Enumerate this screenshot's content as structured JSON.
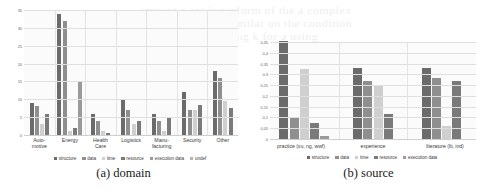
{
  "figure": {
    "bleed_lines": [
      "amount a set is perform of the a complex",
      "because a source similar on the condition",
      "these are using k for a using"
    ]
  },
  "panels": [
    {
      "id": "a",
      "caption": "(a) domain",
      "legend": [
        "structure",
        "data",
        "time",
        "resource",
        "execution data",
        "undef"
      ],
      "colors": [
        "#6b6b6b",
        "#8f8f8f",
        "#cfcfcf",
        "#7a7a7a",
        "#9a9a9a",
        "#b5b5b5"
      ],
      "chart_data": {
        "type": "bar",
        "title": "(a) domain",
        "xlabel": "",
        "ylabel": "",
        "ylim": [
          0,
          35
        ],
        "yticks": [
          0,
          5,
          10,
          15,
          20,
          25,
          30,
          35
        ],
        "ytick_labels": [
          "0",
          "5",
          "10",
          "15",
          "20",
          "25",
          "30",
          "35"
        ],
        "grid": true,
        "legend_position": "bottom",
        "categories": [
          "Auto-\nmotive",
          "Energy",
          "Health\nCare",
          "Logistics",
          "Manu-\nfacturing",
          "Security",
          "Other"
        ],
        "series": [
          {
            "name": "structure",
            "values": [
              9,
              34,
              6,
              10,
              6,
              12,
              18
            ]
          },
          {
            "name": "data",
            "values": [
              8,
              32,
              4,
              7,
              4,
              7,
              16
            ]
          },
          {
            "name": "time",
            "values": [
              3,
              1,
              1,
              3,
              1,
              7,
              9.5
            ]
          },
          {
            "name": "resource",
            "values": [
              6,
              2,
              0.6,
              4,
              5,
              8.5,
              7.5
            ]
          },
          {
            "name": "execution data",
            "values": [
              0,
              15,
              0,
              0,
              0,
              0,
              0
            ]
          },
          {
            "name": "undef",
            "values": [
              0,
              0,
              0,
              0,
              0,
              0,
              0
            ]
          }
        ]
      }
    },
    {
      "id": "b",
      "caption": "(b) source",
      "legend": [
        "structure",
        "data",
        "time",
        "resource",
        "execution data"
      ],
      "colors": [
        "#6b6b6b",
        "#8f8f8f",
        "#cfcfcf",
        "#7a7a7a",
        "#9a9a9a"
      ],
      "chart_data": {
        "type": "bar",
        "title": "(b) source",
        "xlabel": "",
        "ylabel": "",
        "ylim": [
          0,
          0.45
        ],
        "yticks": [
          0,
          0.05,
          0.1,
          0.15,
          0.2,
          0.25,
          0.3,
          0.35,
          0.4,
          0.45
        ],
        "ytick_labels": [
          "0",
          "0,05",
          "0,1",
          "0,15",
          "0,2",
          "0,25",
          "0,3",
          "0,35",
          "0,4",
          "0,45"
        ],
        "grid": true,
        "legend_position": "bottom",
        "categories": [
          "practice (xu, ng, wwf)",
          "experience",
          "literature (lit, ind)"
        ],
        "series": [
          {
            "name": "structure",
            "values": [
              0.455,
              0.33,
              0.33
            ]
          },
          {
            "name": "data",
            "values": [
              0.1,
              0.27,
              0.285
            ]
          },
          {
            "name": "time",
            "values": [
              0.325,
              0.25,
              0.06
            ]
          },
          {
            "name": "resource",
            "values": [
              0.075,
              0.115,
              0.27
            ]
          },
          {
            "name": "execution data",
            "values": [
              0.012,
              0,
              0
            ]
          }
        ]
      }
    }
  ]
}
